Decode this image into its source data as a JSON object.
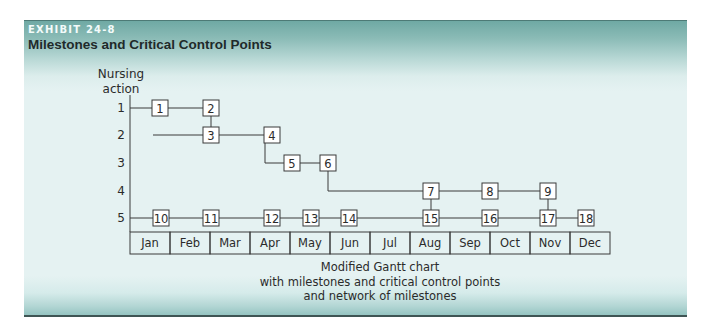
{
  "exhibit": {
    "label": "EXHIBIT 24-8",
    "title": "Milestones and Critical Control Points"
  },
  "diagram": {
    "y_axis_title_line1": "Nursing",
    "y_axis_title_line2": "action",
    "rows": [
      "1",
      "2",
      "3",
      "4",
      "5"
    ],
    "months": [
      "Jan",
      "Feb",
      "Mar",
      "Apr",
      "May",
      "Jun",
      "Jul",
      "Aug",
      "Sep",
      "Oct",
      "Nov",
      "Dec"
    ],
    "milestones": [
      {
        "id": "1",
        "row": 1,
        "month_pos": 1.0
      },
      {
        "id": "2",
        "row": 1,
        "month_pos": 2.3
      },
      {
        "id": "3",
        "row": 2,
        "month_pos": 2.3
      },
      {
        "id": "4",
        "row": 2,
        "month_pos": 3.8
      },
      {
        "id": "5",
        "row": 3,
        "month_pos": 4.3
      },
      {
        "id": "6",
        "row": 3,
        "month_pos": 5.2
      },
      {
        "id": "7",
        "row": 4,
        "month_pos": 7.8
      },
      {
        "id": "8",
        "row": 4,
        "month_pos": 9.3
      },
      {
        "id": "9",
        "row": 4,
        "month_pos": 10.75
      },
      {
        "id": "10",
        "row": 5,
        "month_pos": 1.0
      },
      {
        "id": "11",
        "row": 5,
        "month_pos": 2.3
      },
      {
        "id": "12",
        "row": 5,
        "month_pos": 3.8
      },
      {
        "id": "13",
        "row": 5,
        "month_pos": 4.8
      },
      {
        "id": "14",
        "row": 5,
        "month_pos": 5.75
      },
      {
        "id": "15",
        "row": 5,
        "month_pos": 7.8
      },
      {
        "id": "16",
        "row": 5,
        "month_pos": 9.3
      },
      {
        "id": "17",
        "row": 5,
        "month_pos": 10.75
      },
      {
        "id": "18",
        "row": 5,
        "month_pos": 11.7
      }
    ],
    "connections": [
      [
        "1",
        "2"
      ],
      [
        "2",
        "3"
      ],
      [
        "3",
        "4"
      ],
      [
        "4",
        "5"
      ],
      [
        "5",
        "6"
      ],
      [
        "6",
        "7"
      ],
      [
        "7",
        "8"
      ],
      [
        "8",
        "9"
      ],
      [
        "7",
        "15"
      ],
      [
        "9",
        "17"
      ],
      [
        "10",
        "11"
      ],
      [
        "11",
        "12"
      ],
      [
        "12",
        "13"
      ],
      [
        "13",
        "14"
      ],
      [
        "14",
        "15"
      ],
      [
        "15",
        "16"
      ],
      [
        "16",
        "17"
      ],
      [
        "17",
        "18"
      ]
    ]
  },
  "caption": {
    "line1": "Modified Gantt chart",
    "line2": "with milestones and critical control points",
    "line3": "and network of milestones"
  }
}
